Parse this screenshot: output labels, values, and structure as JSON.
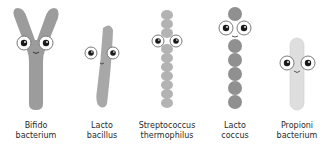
{
  "bacteria": [
    {
      "name_line1": "Bifido",
      "name_line2": "bacterium",
      "shape": "y-shaped-rod",
      "color": "#9a9a9a"
    },
    {
      "name_line1": "Lacto",
      "name_line2": "bacillus",
      "shape": "curved-rod",
      "color": "#a6a6a6"
    },
    {
      "name_line1": "Streptococcus",
      "name_line2": "thermophilus",
      "shape": "chain-of-cocci",
      "color": "#b3b3b3"
    },
    {
      "name_line1": "Lacto",
      "name_line2": "coccus",
      "shape": "chain-of-cocci",
      "color": "#8f8f8f"
    },
    {
      "name_line1": "Propioni",
      "name_line2": "bacterium",
      "shape": "pale-rod",
      "color": "#dcdcdc"
    }
  ]
}
